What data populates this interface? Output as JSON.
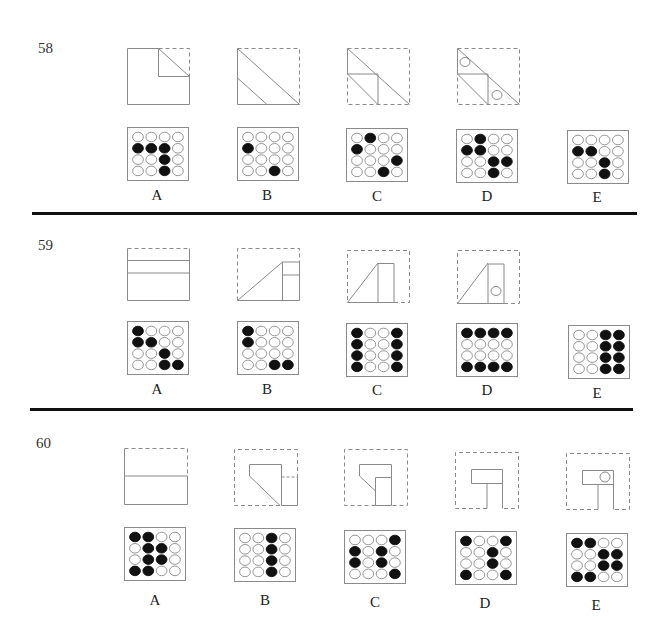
{
  "colors": {
    "line": "#8a8a8a",
    "dot_filled": "#111111",
    "dot_empty_stroke": "#8a8a8a",
    "divider": "#111111"
  },
  "questions": [
    {
      "number": "58",
      "options": [
        {
          "label": "A",
          "grid": [
            [
              0,
              0,
              0,
              0
            ],
            [
              1,
              1,
              1,
              0
            ],
            [
              0,
              0,
              1,
              0
            ],
            [
              0,
              0,
              1,
              0
            ]
          ]
        },
        {
          "label": "B",
          "grid": [
            [
              0,
              0,
              0,
              0
            ],
            [
              1,
              0,
              0,
              0
            ],
            [
              0,
              0,
              0,
              0
            ],
            [
              0,
              0,
              1,
              0
            ]
          ]
        },
        {
          "label": "C",
          "grid": [
            [
              0,
              1,
              0,
              0
            ],
            [
              1,
              0,
              0,
              0
            ],
            [
              0,
              0,
              0,
              1
            ],
            [
              0,
              0,
              1,
              0
            ]
          ]
        },
        {
          "label": "D",
          "grid": [
            [
              0,
              1,
              0,
              0
            ],
            [
              1,
              1,
              0,
              0
            ],
            [
              0,
              0,
              1,
              1
            ],
            [
              0,
              0,
              1,
              0
            ]
          ]
        },
        {
          "label": "E",
          "grid": [
            [
              0,
              0,
              0,
              0
            ],
            [
              1,
              1,
              0,
              0
            ],
            [
              0,
              0,
              1,
              0
            ],
            [
              0,
              0,
              1,
              0
            ]
          ]
        }
      ]
    },
    {
      "number": "59",
      "options": [
        {
          "label": "A",
          "grid": [
            [
              1,
              0,
              0,
              0
            ],
            [
              1,
              1,
              0,
              0
            ],
            [
              0,
              0,
              1,
              0
            ],
            [
              0,
              0,
              1,
              1
            ]
          ]
        },
        {
          "label": "B",
          "grid": [
            [
              1,
              0,
              0,
              0
            ],
            [
              1,
              0,
              0,
              0
            ],
            [
              0,
              0,
              0,
              0
            ],
            [
              0,
              0,
              1,
              1
            ]
          ]
        },
        {
          "label": "C",
          "grid": [
            [
              1,
              0,
              0,
              1
            ],
            [
              1,
              0,
              0,
              1
            ],
            [
              1,
              0,
              0,
              1
            ],
            [
              1,
              0,
              0,
              1
            ]
          ]
        },
        {
          "label": "D",
          "grid": [
            [
              1,
              1,
              1,
              1
            ],
            [
              0,
              0,
              0,
              0
            ],
            [
              0,
              0,
              0,
              0
            ],
            [
              1,
              1,
              1,
              1
            ]
          ]
        },
        {
          "label": "E",
          "grid": [
            [
              0,
              0,
              1,
              1
            ],
            [
              0,
              0,
              1,
              1
            ],
            [
              0,
              0,
              1,
              1
            ],
            [
              0,
              0,
              1,
              1
            ]
          ]
        }
      ]
    },
    {
      "number": "60",
      "options": [
        {
          "label": "A",
          "grid": [
            [
              1,
              1,
              0,
              0
            ],
            [
              0,
              1,
              1,
              0
            ],
            [
              0,
              1,
              1,
              0
            ],
            [
              1,
              1,
              0,
              0
            ]
          ]
        },
        {
          "label": "B",
          "grid": [
            [
              0,
              0,
              1,
              0
            ],
            [
              0,
              0,
              1,
              0
            ],
            [
              0,
              0,
              1,
              0
            ],
            [
              0,
              0,
              1,
              0
            ]
          ]
        },
        {
          "label": "C",
          "grid": [
            [
              0,
              0,
              0,
              1
            ],
            [
              1,
              0,
              1,
              0
            ],
            [
              1,
              0,
              1,
              0
            ],
            [
              0,
              0,
              0,
              1
            ]
          ]
        },
        {
          "label": "D",
          "grid": [
            [
              1,
              0,
              0,
              1
            ],
            [
              0,
              0,
              1,
              0
            ],
            [
              0,
              0,
              1,
              0
            ],
            [
              1,
              0,
              0,
              1
            ]
          ]
        },
        {
          "label": "E",
          "grid": [
            [
              1,
              1,
              0,
              0
            ],
            [
              0,
              0,
              1,
              1
            ],
            [
              0,
              0,
              1,
              1
            ],
            [
              1,
              1,
              0,
              0
            ]
          ]
        }
      ]
    }
  ]
}
